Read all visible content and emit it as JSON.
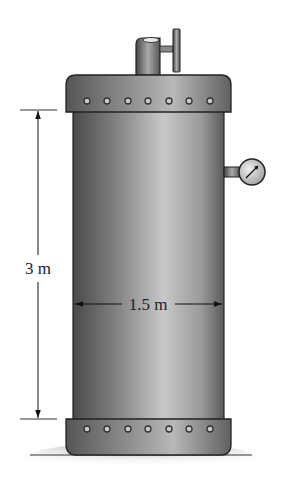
{
  "figure": {
    "dimensions": {
      "height_label": "3 m",
      "diameter_label": "1.5 m"
    },
    "components": {
      "top_cap_bolts": 7,
      "bottom_cap_bolts": 7,
      "icons": [
        "valve-handle-icon",
        "pressure-gauge-icon"
      ]
    },
    "colors": {
      "tank_dark": "#4a4a4a",
      "tank_mid": "#8a8a8a",
      "tank_light": "#d0d0d0",
      "outline": "#222222",
      "bolt_fill": "#c8c8c8"
    }
  }
}
